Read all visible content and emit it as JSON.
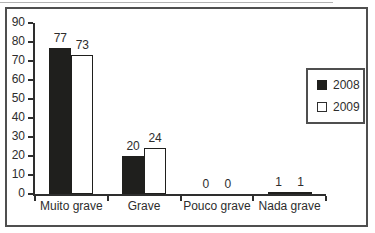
{
  "chart_data": {
    "type": "bar",
    "categories": [
      "Muito grave",
      "Grave",
      "Pouco grave",
      "Nada grave"
    ],
    "series": [
      {
        "name": "2008",
        "style": "filled",
        "values": [
          77,
          20,
          0,
          1
        ]
      },
      {
        "name": "2009",
        "style": "outlined",
        "values": [
          73,
          24,
          0,
          1
        ]
      }
    ],
    "title": "",
    "xlabel": "",
    "ylabel": "",
    "ylim": [
      0,
      90
    ],
    "yticks": [
      0,
      10,
      20,
      30,
      40,
      50,
      60,
      70,
      80,
      90
    ],
    "grid": false,
    "show_value_labels": true,
    "legend": {
      "position": "right",
      "entries": [
        "2008",
        "2009"
      ]
    },
    "colors": {
      "filled_bar": "#1f1f1d",
      "outlined_bar_fill": "#ffffff",
      "bar_outline": "#1f1f1d",
      "axis": "#2e2e2e",
      "frame_border": "#4f4f4f",
      "text": "#2d2d2d",
      "background": "#ffffff"
    }
  }
}
